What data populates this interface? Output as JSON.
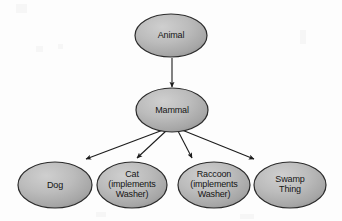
{
  "diagram": {
    "type": "inheritance-tree",
    "style": {
      "background": "#fdfdfd",
      "node_fill_light": "#c9c9c9",
      "node_fill_dark": "#9a9a9a",
      "node_stroke": "#2b2b2b",
      "text_color": "#141414",
      "edge_color": "#1c1c1c"
    },
    "nodes": [
      {
        "id": "animal",
        "label": "Animal",
        "lines": [
          "Animal"
        ],
        "cx": 171,
        "cy": 35.5,
        "rx": 36,
        "ry": 21.5
      },
      {
        "id": "mammal",
        "label": "Mammal",
        "lines": [
          "Mammal"
        ],
        "cx": 172,
        "cy": 110,
        "rx": 36,
        "ry": 22
      },
      {
        "id": "dog",
        "label": "Dog",
        "lines": [
          "Dog"
        ],
        "cx": 55,
        "cy": 185,
        "rx": 37,
        "ry": 23
      },
      {
        "id": "cat",
        "label": "Cat (implements Washer)",
        "lines": [
          "Cat",
          "(implements",
          "Washer)"
        ],
        "cx": 132,
        "cy": 185,
        "rx": 35,
        "ry": 23
      },
      {
        "id": "raccoon",
        "label": "Raccoon (implements Washer)",
        "lines": [
          "Raccoon",
          "(implements",
          "Washer)"
        ],
        "cx": 214,
        "cy": 185,
        "rx": 36,
        "ry": 23
      },
      {
        "id": "swamp-thing",
        "label": "Swamp Thing",
        "lines": [
          "Swamp",
          "Thing"
        ],
        "cx": 290,
        "cy": 185,
        "rx": 36,
        "ry": 23
      }
    ],
    "edges": [
      {
        "id": "animal-to-mammal",
        "from": "animal",
        "to": "mammal",
        "arrow": "filled-triangle"
      },
      {
        "id": "mammal-to-dog",
        "from": "mammal",
        "to": "dog",
        "arrow": "filled-triangle"
      },
      {
        "id": "mammal-to-cat",
        "from": "mammal",
        "to": "cat",
        "arrow": "filled-triangle"
      },
      {
        "id": "mammal-to-raccoon",
        "from": "mammal",
        "to": "raccoon",
        "arrow": "filled-triangle"
      },
      {
        "id": "mammal-to-swamp-thing",
        "from": "mammal",
        "to": "swamp-thing",
        "arrow": "filled-triangle"
      }
    ]
  }
}
